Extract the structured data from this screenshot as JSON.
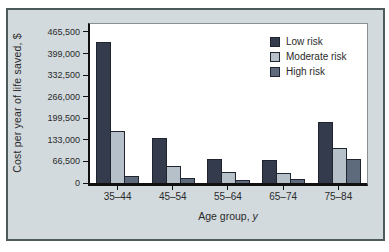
{
  "theme": {
    "card_bg": "#d2dade",
    "card_border": "#4d5a5a",
    "plot_bg": "#ffffff",
    "axis_color": "#101010",
    "text_color": "#2a2a2a"
  },
  "chart_data": {
    "type": "bar",
    "title": "",
    "categories": [
      "35–44",
      "45–54",
      "55–64",
      "65–74",
      "75–84"
    ],
    "series": [
      {
        "name": "Low risk",
        "color": "#343b4d",
        "values": [
          435000,
          138000,
          73000,
          72000,
          188000
        ]
      },
      {
        "name": "Moderate risk",
        "color": "#b6c0c9",
        "values": [
          160000,
          53000,
          33000,
          30000,
          109000
        ]
      },
      {
        "name": "High risk",
        "color": "#5e6b7d",
        "values": [
          23000,
          14000,
          9000,
          12000,
          73000
        ]
      }
    ],
    "xlabel": "Age group, y",
    "xlabel_prefix": "Age group, ",
    "xlabel_italic": "y",
    "ylabel": "Cost per year of life saved, $",
    "ylim": [
      0,
      490000
    ],
    "yticks": [
      0,
      66500,
      133000,
      199500,
      266000,
      332500,
      399000,
      465500
    ],
    "ytick_labels": [
      "0",
      "66,500",
      "133,000",
      "199,500",
      "266,000",
      "332,500",
      "399,000",
      "465,500"
    ],
    "grid": false,
    "legend_position": "upper right"
  }
}
